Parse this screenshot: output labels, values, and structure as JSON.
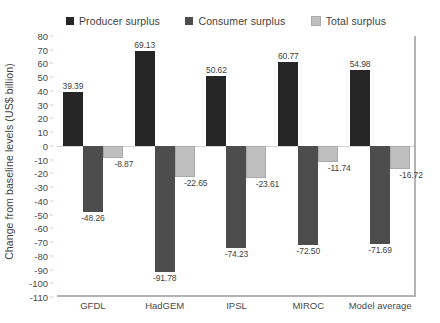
{
  "chart_data": {
    "type": "bar",
    "title": "",
    "subtitle": "",
    "xlabel": "",
    "ylabel": "Change from baseline levels (US$ billion)",
    "categories": [
      "GFDL",
      "HadGEM",
      "IPSL",
      "MIROC",
      "Model average"
    ],
    "series": [
      {
        "name": "Producer surplus",
        "color": "#262626",
        "values": [
          39.39,
          69.13,
          50.62,
          60.77,
          54.98
        ],
        "labels": [
          "39.39",
          "69.13",
          "50.62",
          "60.77",
          "54.98"
        ]
      },
      {
        "name": "Consumer surplus",
        "color": "#4d4d4d",
        "values": [
          -48.26,
          -91.78,
          -74.23,
          -72.5,
          -71.69
        ],
        "labels": [
          "-48.26",
          "-91.78",
          "-74.23",
          "-72.50",
          "-71.69"
        ]
      },
      {
        "name": "Total surplus",
        "color": "#bfbfbf",
        "values": [
          -8.87,
          -22.65,
          -23.61,
          -11.74,
          -16.72
        ],
        "labels": [
          "-8.87",
          "-22.65",
          "-23.61",
          "-11.74",
          "-16.72"
        ]
      }
    ],
    "ylim": [
      -110,
      80
    ],
    "ytick_step": 10,
    "yticks": [
      80,
      70,
      60,
      50,
      40,
      30,
      20,
      10,
      0,
      -10,
      -20,
      -30,
      -40,
      -50,
      -60,
      -70,
      -80,
      -90,
      -100,
      -110
    ],
    "ytick_labels": [
      "80",
      "70",
      "60",
      "50",
      "40",
      "30",
      "20",
      "10",
      "0",
      "-10",
      "-20",
      "-30",
      "-40",
      "-50",
      "-60",
      "-70",
      "-80",
      "-90",
      "-100",
      "-110"
    ],
    "grid": false,
    "zero_line": true,
    "legend_position": "top"
  }
}
